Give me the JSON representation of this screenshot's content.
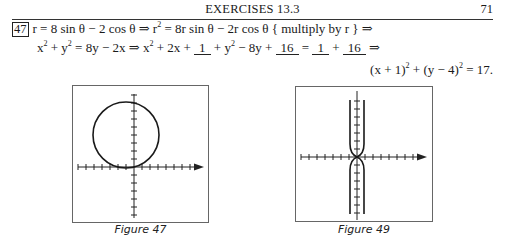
{
  "header": {
    "title": "EXERCISES 13.3",
    "page_number": "71"
  },
  "exercise": {
    "number": "47",
    "line1": {
      "part1": "r = 8 sin θ − 2 cos θ ⇒ r",
      "exp1": "2",
      "part2": " = 8r sin θ − 2r cos θ { multiply by r } ⇒"
    },
    "line2": {
      "a": "x",
      "a_exp": "2",
      "b": " + y",
      "b_exp": "2",
      "c": " = 8y − 2x ⇒ x",
      "c_exp": "2",
      "d": " + 2x + ",
      "blank1": "1",
      "e": " + y",
      "e_exp": "2",
      "f": " − 8y + ",
      "blank2": "16",
      "g": " = ",
      "blank3": "1",
      "h": " + ",
      "blank4": "16",
      "i": " ⇒"
    },
    "line3": {
      "a": "(x + 1)",
      "a_exp": "2",
      "b": " + (y − 4)",
      "b_exp": "2",
      "c": " = 17."
    }
  },
  "figures": [
    {
      "caption": "Figure 47",
      "description": "Circle centered at (-1, 4) with radius sqrt(17), on axes with unit tick marks"
    },
    {
      "caption": "Figure 49",
      "description": "Two curves near the y-axis that pinch together at the origin, on axes with tick marks"
    }
  ],
  "colors": {
    "ink": "#1a1a1a",
    "frame": "#555555"
  }
}
